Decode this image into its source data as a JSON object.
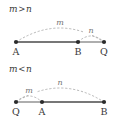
{
  "figure": {
    "background_color": "#ffffff",
    "segment_color_primary": "#4a4a4a",
    "segment_color_secondary": "#9a9a9a",
    "arc_color": "#9a9a9a",
    "dot_color": "#2b2b2b",
    "label_color": "#3a3a3a"
  },
  "panels": [
    {
      "name": "case-m-greater-than-n",
      "case_label": {
        "left_symbol": "m",
        "relation": ">",
        "right_symbol": "n"
      },
      "points": [
        {
          "id": "A",
          "label": "A",
          "x": 16
        },
        {
          "id": "B",
          "label": "B",
          "x": 78
        },
        {
          "id": "Q",
          "label": "Q",
          "x": 104
        }
      ],
      "segments": [
        {
          "from": "A",
          "to": "B",
          "style": "solid-dark"
        },
        {
          "from": "B",
          "to": "Q",
          "style": "solid-gray"
        }
      ],
      "arcs": [
        {
          "label": "m",
          "from": "A",
          "to": "Q",
          "style": "dashed",
          "side": "above"
        },
        {
          "label": "n",
          "from": "B",
          "to": "Q",
          "style": "dashed",
          "side": "above"
        }
      ]
    },
    {
      "name": "case-m-less-than-n",
      "case_label": {
        "left_symbol": "m",
        "relation": "<",
        "right_symbol": "n"
      },
      "points": [
        {
          "id": "Q",
          "label": "Q",
          "x": 16
        },
        {
          "id": "A",
          "label": "A",
          "x": 42
        },
        {
          "id": "B",
          "label": "B",
          "x": 104
        }
      ],
      "segments": [
        {
          "from": "Q",
          "to": "A",
          "style": "solid-gray"
        },
        {
          "from": "A",
          "to": "B",
          "style": "solid-dark"
        }
      ],
      "arcs": [
        {
          "label": "n",
          "from": "Q",
          "to": "B",
          "style": "dashed",
          "side": "above"
        },
        {
          "label": "m",
          "from": "Q",
          "to": "A",
          "style": "dashed",
          "side": "above"
        }
      ]
    }
  ]
}
